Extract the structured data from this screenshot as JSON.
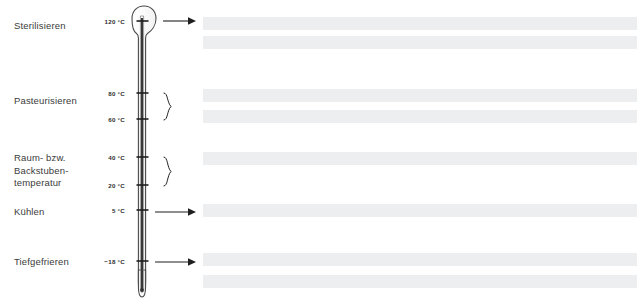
{
  "diagram": {
    "language": "de",
    "colors": {
      "text": "#3b3b3b",
      "scale_text": "#2e2e2e",
      "thermometer_outline": "#4a4a4a",
      "mercury": "#2b2b2b",
      "tick": "#1f1f1f",
      "connector": "#1f1f1f",
      "bar_fill": "#edeeef",
      "background": "#ffffff"
    }
  },
  "zone_labels": [
    {
      "id": "sterilisieren",
      "text": "Sterilisieren",
      "x": 14,
      "y": 20,
      "lines": 1
    },
    {
      "id": "pasteurisieren",
      "text": "Pasteurisieren",
      "x": 14,
      "y": 95,
      "lines": 1
    },
    {
      "id": "raumtemperatur",
      "text": "Raum- bzw.\nBackstuben-\ntemperatur",
      "x": 14,
      "y": 152,
      "lines": 3
    },
    {
      "id": "kuehlen",
      "text": "Kühlen",
      "x": 14,
      "y": 206,
      "lines": 1
    },
    {
      "id": "tiefgefrieren",
      "text": "Tiefgefrieren",
      "x": 14,
      "y": 256,
      "lines": 1
    }
  ],
  "scale": {
    "unit": "°C",
    "marks": [
      {
        "value": "120 °C",
        "y": 21,
        "tick": true
      },
      {
        "value": "80 °C",
        "y": 93,
        "tick": true
      },
      {
        "value": "60 °C",
        "y": 119,
        "tick": true
      },
      {
        "value": "40 °C",
        "y": 157,
        "tick": true
      },
      {
        "value": "20 °C",
        "y": 185,
        "tick": true
      },
      {
        "value": "5 °C",
        "y": 210,
        "tick": true
      },
      {
        "value": "−18 °C",
        "y": 261,
        "tick": true
      }
    ]
  },
  "connectors": [
    {
      "id": "arrow-sterilisieren",
      "type": "arrow",
      "y": 21,
      "from_x": 163,
      "to_x": 196
    },
    {
      "id": "brace-pasteurisieren",
      "type": "brace",
      "y_top": 93,
      "y_bottom": 120,
      "x": 162
    },
    {
      "id": "brace-raumtemperatur",
      "type": "brace",
      "y_top": 157,
      "y_bottom": 186,
      "x": 162
    },
    {
      "id": "arrow-kuehlen",
      "type": "arrow",
      "y": 212,
      "from_x": 155,
      "to_x": 196
    },
    {
      "id": "arrow-tiefgefrieren",
      "type": "arrow",
      "y": 262,
      "from_x": 155,
      "to_x": 196
    }
  ],
  "text_bars": [
    {
      "id": "bar-1",
      "x": 203,
      "y": 17,
      "width": 434,
      "height": 13
    },
    {
      "id": "bar-2",
      "x": 203,
      "y": 36,
      "width": 434,
      "height": 13
    },
    {
      "id": "bar-3",
      "x": 203,
      "y": 89,
      "width": 434,
      "height": 13
    },
    {
      "id": "bar-4",
      "x": 203,
      "y": 110,
      "width": 434,
      "height": 13
    },
    {
      "id": "bar-5",
      "x": 203,
      "y": 152,
      "width": 434,
      "height": 13
    },
    {
      "id": "bar-6",
      "x": 203,
      "y": 204,
      "width": 434,
      "height": 13
    },
    {
      "id": "bar-7",
      "x": 203,
      "y": 253,
      "width": 434,
      "height": 13
    },
    {
      "id": "bar-8",
      "x": 203,
      "y": 275,
      "width": 434,
      "height": 13
    }
  ]
}
